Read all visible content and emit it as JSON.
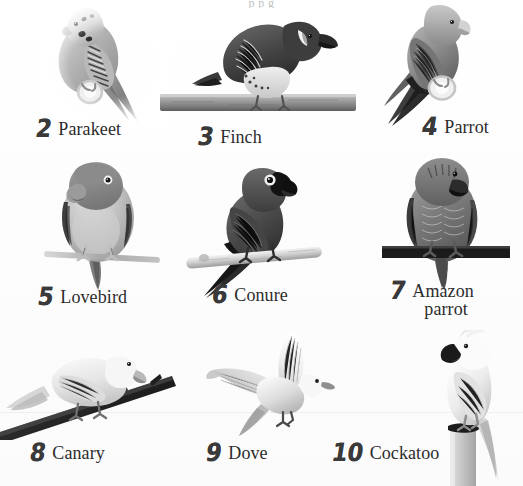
{
  "page": {
    "kind": "picture-dictionary-page",
    "background_color": "#fdfdfd",
    "ink_color": "#2c2c2c",
    "numeral_color": "#3a3a3a",
    "top_cut_text": "p p     g",
    "columns": 3,
    "rows": 3
  },
  "items": [
    {
      "number": "2",
      "name": "Parakeet",
      "name_line2": "",
      "icon": "parakeet-bird-photo",
      "perch": "ring-perch"
    },
    {
      "number": "3",
      "name": "Finch",
      "name_line2": "",
      "icon": "finch-bird-photo",
      "perch": "wide-wooden-branch"
    },
    {
      "number": "4",
      "name": "Parrot",
      "name_line2": "",
      "icon": "parrot-bird-photo",
      "perch": "ring-perch"
    },
    {
      "number": "5",
      "name": "Lovebird",
      "name_line2": "",
      "icon": "lovebird-bird-photo",
      "perch": "thin-branch"
    },
    {
      "number": "6",
      "name": "Conure",
      "name_line2": "",
      "icon": "conure-bird-photo",
      "perch": "pale-wooden-dowel"
    },
    {
      "number": "7",
      "name": "Amazon",
      "name_line2": "parrot",
      "icon": "amazon-parrot-bird-photo",
      "perch": "dark-flat-bar"
    },
    {
      "number": "8",
      "name": "Canary",
      "name_line2": "",
      "icon": "canary-bird-photo",
      "perch": "diagonal-dark-branch"
    },
    {
      "number": "9",
      "name": "Dove",
      "name_line2": "",
      "icon": "dove-bird-photo",
      "perch": "none-in-flight"
    },
    {
      "number": "10",
      "name": "Cockatoo",
      "name_line2": "",
      "icon": "cockatoo-bird-photo",
      "perch": "vertical-post"
    }
  ]
}
